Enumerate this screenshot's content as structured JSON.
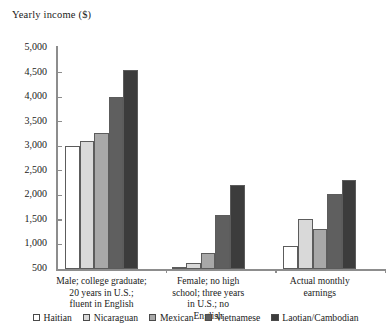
{
  "chart_data": {
    "type": "bar",
    "title": "Yearly income ($)",
    "xlabel": "",
    "ylabel": "Yearly income ($)",
    "ylim": [
      500,
      5000
    ],
    "ytick_labels": [
      "5,000",
      "4,500",
      "4,000",
      "3,500",
      "3,000",
      "2,500",
      "2,000",
      "1,500",
      "1,000",
      "500"
    ],
    "ytick_values": [
      5000,
      4500,
      4000,
      3500,
      3000,
      2500,
      2000,
      1500,
      1000,
      500
    ],
    "grid": false,
    "legend_position": "bottom",
    "categories": [
      "Male; college graduate;\n20 years in U.S.;\nfluent in English",
      "Female; no high\nschool; three years\nin U.S.; no\nEnglish",
      "Actual monthly\nearnings"
    ],
    "series": [
      {
        "name": "Haitian",
        "color": "#ffffff",
        "values": [
          3000,
          530,
          960
        ]
      },
      {
        "name": "Nicaraguan",
        "color": "#d9d9d9",
        "values": [
          3110,
          620,
          1520
        ]
      },
      {
        "name": "Mexican",
        "color": "#a8a8a8",
        "values": [
          3260,
          820,
          1310
        ]
      },
      {
        "name": "Vietnamese",
        "color": "#5f5f5f",
        "values": [
          4000,
          1600,
          2020
        ]
      },
      {
        "name": "Laotian/Cambodian",
        "color": "#3c3c3c",
        "values": [
          4550,
          2210,
          2310
        ]
      }
    ]
  },
  "legend": {
    "items": [
      {
        "label": "Haitian"
      },
      {
        "label": "Nicaraguan"
      },
      {
        "label": "Mexican"
      },
      {
        "label": "Vietnamese"
      },
      {
        "label": "Laotian/Cambodian"
      }
    ]
  }
}
